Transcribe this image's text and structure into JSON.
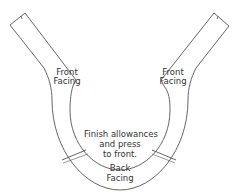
{
  "diagram": {
    "type": "sewing-pattern-facing",
    "stroke_color": "#555555",
    "labels": {
      "front_facing_left": [
        "Front",
        "Facing"
      ],
      "front_facing_right": [
        "Front",
        "Facing"
      ],
      "instruction": [
        "Finish allowances",
        "and press",
        "to front."
      ],
      "back_facing": [
        "Back",
        "Facing"
      ]
    }
  }
}
